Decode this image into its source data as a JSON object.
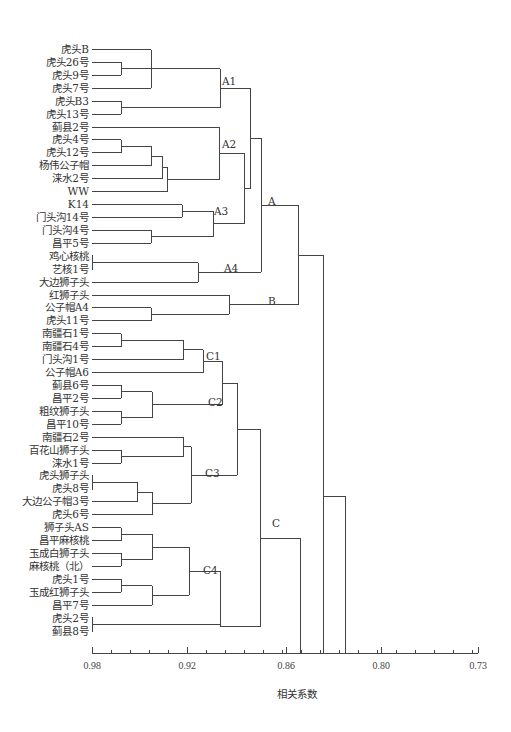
{
  "chart_data": {
    "type": "dendrogram",
    "title": "",
    "xlabel": "相关系数",
    "ylabel": "",
    "xlim": [
      0.98,
      0.73
    ],
    "axis": {
      "ticks": [
        {
          "label": "0.98",
          "x": 92
        },
        {
          "label": "0.92",
          "x": 187
        },
        {
          "label": "0.86",
          "x": 286
        },
        {
          "label": "0.80",
          "x": 381
        },
        {
          "label": "0.73",
          "x": 478
        }
      ],
      "minor_tick_spacing_px": 19,
      "y": 653,
      "x_start": 92,
      "x_end": 478
    },
    "leaves": [
      "虎头B",
      "虎头26号",
      "虎头9号",
      "虎头7号",
      "虎头B3",
      "虎头13号",
      "蓟县2号",
      "虎头4号",
      "虎头12号",
      "杨伟公子帽",
      "涞水2号",
      "WW",
      "K14",
      "门头沟14号",
      "门头沟4号",
      "昌平5号",
      "鸡心核桃",
      "艺核1号",
      "大边狮子头",
      "红狮子头",
      "公子帽A4",
      "虎头11号",
      "南疆石1号",
      "南疆石4号",
      "门头沟1号",
      "公子帽A6",
      "蓟县6号",
      "昌平2号",
      "粗纹狮子头",
      "昌平10号",
      "南疆石2号",
      "百花山狮子头",
      "涞水1号",
      "虎头狮子头",
      "虎头8号",
      "大边公子帽3号",
      "虎头6号",
      "狮子头AS",
      "昌平麻核桃",
      "玉成白狮子头",
      "麻核桃（北）",
      "虎头1号",
      "玉成红狮子头",
      "昌平7号",
      "虎头2号",
      "蓟县8号"
    ],
    "clusters": [
      {
        "label": "A1",
        "x": 222,
        "y": 81
      },
      {
        "label": "A2",
        "x": 222,
        "y": 144
      },
      {
        "label": "A3",
        "x": 214,
        "y": 211
      },
      {
        "label": "A4",
        "x": 224,
        "y": 268
      },
      {
        "label": "A",
        "x": 268,
        "y": 201
      },
      {
        "label": "B",
        "x": 268,
        "y": 301
      },
      {
        "label": "C1",
        "x": 206,
        "y": 356
      },
      {
        "label": "C2",
        "x": 208,
        "y": 402
      },
      {
        "label": "C3",
        "x": 205,
        "y": 473
      },
      {
        "label": "C4",
        "x": 203,
        "y": 570
      },
      {
        "label": "C",
        "x": 272,
        "y": 523
      }
    ]
  }
}
